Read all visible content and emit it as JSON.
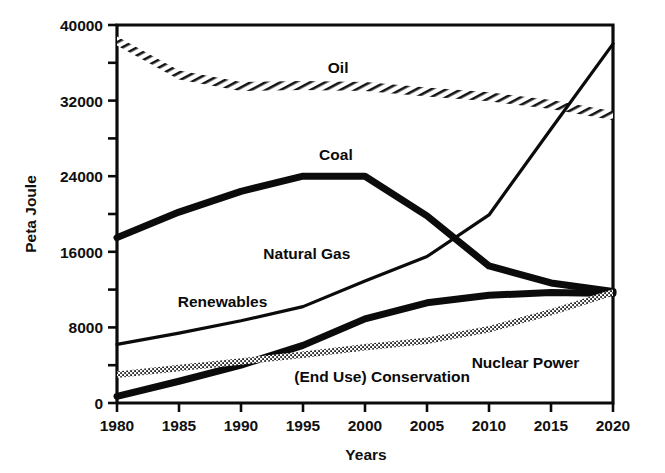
{
  "chart_data": {
    "type": "line",
    "title": "",
    "xlabel": "Years",
    "ylabel": "Peta Joule",
    "xlim": [
      1980,
      2020
    ],
    "ylim": [
      0,
      40000
    ],
    "xticks": [
      1980,
      1985,
      1990,
      1995,
      2000,
      2005,
      2010,
      2015,
      2020
    ],
    "xtick_labels": [
      "1980",
      "1985",
      "1990",
      "1995",
      "2000",
      "2005",
      "2010",
      "2015",
      "2020"
    ],
    "yticks": [
      0,
      8000,
      16000,
      24000,
      32000,
      40000
    ],
    "ytick_labels": [
      "0",
      "8000",
      "16000",
      "24000",
      "32000",
      "40000"
    ],
    "yticks_minor": [
      4000,
      12000,
      20000,
      28000,
      36000
    ],
    "grid": false,
    "legend_position": "inline-labels",
    "x": [
      1980,
      1985,
      1990,
      1995,
      2000,
      2005,
      2010,
      2015,
      2020
    ],
    "series": [
      {
        "name": "Oil",
        "style": "hatched-band",
        "label": "Oil",
        "values": [
          38300,
          34700,
          33500,
          33600,
          33500,
          32900,
          32400,
          31600,
          30400
        ]
      },
      {
        "name": "Coal",
        "style": "thick-solid",
        "label": "Coal",
        "values": [
          17500,
          20200,
          22400,
          24000,
          24000,
          19800,
          14500,
          12700,
          11800
        ]
      },
      {
        "name": "Natural Gas",
        "style": "thin-solid",
        "label": "Natural Gas",
        "values": [
          6200,
          7400,
          8700,
          10200,
          12900,
          15500,
          19900,
          29000,
          38000
        ]
      },
      {
        "name": "Renewables",
        "style": "thin-solid-label",
        "label": "Renewables",
        "values": [
          6200,
          7400,
          8700,
          10200,
          12900,
          15500,
          19900,
          29000,
          38000
        ]
      },
      {
        "name": "(End Use) Conservation",
        "style": "thick-solid",
        "label": "(End Use) Conservation",
        "values": [
          700,
          2300,
          4000,
          6100,
          8900,
          10600,
          11400,
          11700,
          11600
        ]
      },
      {
        "name": "Nuclear Power",
        "style": "dotted",
        "label": "Nuclear Power",
        "values": [
          3000,
          3700,
          4400,
          5100,
          5900,
          6600,
          7800,
          9600,
          11700
        ]
      }
    ],
    "annotations": [
      {
        "text": "Oil",
        "x": 1997,
        "y": 34900
      },
      {
        "text": "Coal",
        "x": 1996.3,
        "y": 25700
      },
      {
        "text": "Natural Gas",
        "x": 1991.8,
        "y": 15200
      },
      {
        "text": "Renewables",
        "x": 1984.9,
        "y": 10200
      },
      {
        "text": "(End Use) Conservation",
        "x": 1994.3,
        "y": 2200
      },
      {
        "text": "Nuclear Power",
        "x": 2008.6,
        "y": 3750
      }
    ],
    "colors": {
      "line": "#0b0b0b",
      "background": "#ffffff",
      "text": "#101010"
    }
  }
}
